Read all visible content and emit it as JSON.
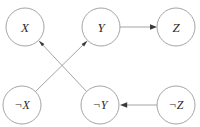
{
  "diagram": {
    "kind": "implication-graph",
    "background_color": "#ffffff",
    "node_stroke_color": "#9a9a9a",
    "node_fill_color": "#ffffff",
    "edge_color": "#9a9a9a",
    "arrow_color": "#3a3a3a",
    "label_color": "#2b2b2b",
    "node_radius": 19,
    "nodes": [
      {
        "id": "x",
        "label": "X",
        "cx": 25,
        "cy": 27,
        "negated": false
      },
      {
        "id": "y",
        "label": "Y",
        "cx": 101,
        "cy": 27,
        "negated": false
      },
      {
        "id": "z",
        "label": "Z",
        "cx": 176,
        "cy": 27,
        "negated": false
      },
      {
        "id": "not-x",
        "label": "¬X",
        "cx": 22,
        "cy": 105,
        "negated": true
      },
      {
        "id": "not-y",
        "label": "¬Y",
        "cx": 100,
        "cy": 105,
        "negated": true
      },
      {
        "id": "not-z",
        "label": "¬Z",
        "cx": 176,
        "cy": 105,
        "negated": true
      }
    ],
    "edges": [
      {
        "id": "edge-not-y-to-x",
        "from": "¬Y",
        "to": "X",
        "direction": "up-left"
      },
      {
        "id": "edge-not-x-to-y",
        "from": "¬X",
        "to": "Y",
        "direction": "up-right"
      },
      {
        "id": "edge-y-to-z",
        "from": "Y",
        "to": "Z",
        "direction": "right"
      },
      {
        "id": "edge-not-z-to-not-y",
        "from": "¬Z",
        "to": "¬Y",
        "direction": "left"
      }
    ]
  }
}
